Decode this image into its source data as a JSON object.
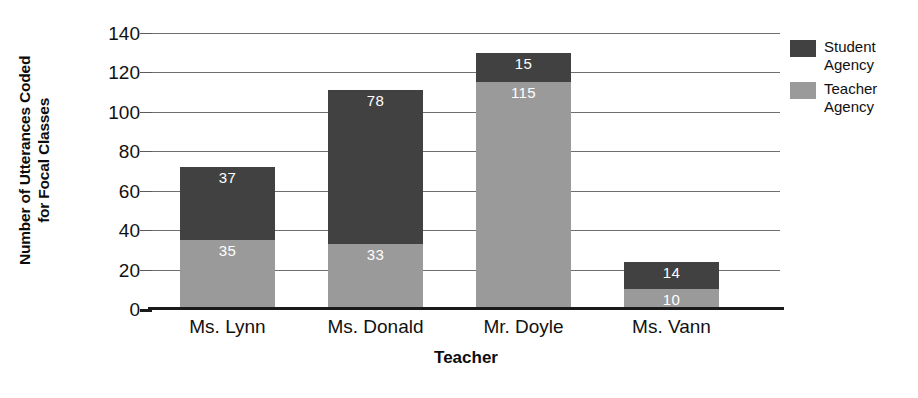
{
  "chart_data": {
    "type": "bar",
    "subtype": "stacked-bar",
    "title": "",
    "xlabel": "Teacher",
    "ylabel": "Number of Utterances Coded for Focal Classes",
    "ylabel_lines": [
      "Number of Utterances Coded",
      "for Focal Classes"
    ],
    "categories": [
      "Ms. Lynn",
      "Ms. Donald",
      "Mr. Doyle",
      "Ms. Vann"
    ],
    "series": [
      {
        "name": "Teacher Agency",
        "color": "#9a9a9a",
        "values": [
          35,
          33,
          115,
          10
        ]
      },
      {
        "name": "Student Agency",
        "color": "#414141",
        "values": [
          37,
          78,
          15,
          14
        ]
      }
    ],
    "stack_order_bottom_to_top": [
      "Teacher Agency",
      "Student Agency"
    ],
    "totals": [
      72,
      111,
      130,
      24
    ],
    "ylim": [
      0,
      140
    ],
    "ytick_values": [
      0,
      20,
      40,
      60,
      80,
      100,
      120,
      140
    ],
    "ytick_labels": [
      "0",
      "20",
      "40",
      "60",
      "80",
      "100",
      "120",
      "140"
    ],
    "grid": true,
    "grid_axis": "y",
    "legend_position": "right",
    "data_labels": true,
    "bars": [
      {
        "category": "Ms. Lynn",
        "teacher_value": 35,
        "teacher_label": "35",
        "student_value": 37,
        "student_label": "37",
        "total": 72
      },
      {
        "category": "Ms. Donald",
        "teacher_value": 33,
        "teacher_label": "33",
        "student_value": 78,
        "student_label": "78",
        "total": 111
      },
      {
        "category": "Mr. Doyle",
        "teacher_value": 115,
        "teacher_label": "115",
        "student_value": 15,
        "student_label": "15",
        "total": 130
      },
      {
        "category": "Ms. Vann",
        "teacher_value": 10,
        "teacher_label": "10",
        "student_value": 14,
        "student_label": "14",
        "total": 24
      }
    ]
  },
  "axes": {
    "y_title_line1": "Number of Utterances Coded",
    "y_title_line2": "for Focal Classes",
    "x_title": "Teacher",
    "y_ticks": [
      "140",
      "120",
      "100",
      "80",
      "60",
      "40",
      "20",
      "0"
    ],
    "x_ticks": [
      "Ms. Lynn",
      "Ms. Donald",
      "Mr. Doyle",
      "Ms. Vann"
    ]
  },
  "legend": {
    "items": [
      {
        "label_line1": "Student",
        "label_line2": "Agency",
        "color": "#414141"
      },
      {
        "label_line1": "Teacher",
        "label_line2": "Agency",
        "color": "#9a9a9a"
      }
    ]
  },
  "colors": {
    "student_agency": "#414141",
    "teacher_agency": "#9a9a9a",
    "gridline": "#6e6e6e",
    "axis": "#1a1a1a",
    "background": "#ffffff",
    "label_text": "#ffffff"
  }
}
